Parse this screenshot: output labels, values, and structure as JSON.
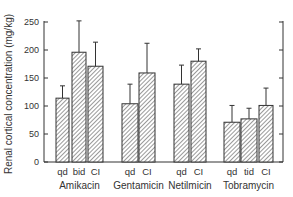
{
  "chart_data": {
    "type": "bar",
    "title": "",
    "xlabel": "",
    "ylabel": "Renal cortical concentration (mg/kg)",
    "ylim": [
      0,
      250
    ],
    "yticks": [
      0,
      50,
      100,
      150,
      200,
      250
    ],
    "grid": false,
    "legend": null,
    "error_bars": true,
    "bar_pattern": "diagonal-hatch",
    "groups": [
      {
        "name": "Amikacin",
        "bars": [
          {
            "label": "qd",
            "value": 114,
            "error_top": 136
          },
          {
            "label": "bid",
            "value": 196,
            "error_top": 252
          },
          {
            "label": "CI",
            "value": 171,
            "error_top": 214
          }
        ]
      },
      {
        "name": "Gentamicin",
        "bars": [
          {
            "label": "qd",
            "value": 104,
            "error_top": 139
          },
          {
            "label": "CI",
            "value": 159,
            "error_top": 212
          }
        ]
      },
      {
        "name": "Netilmicin",
        "bars": [
          {
            "label": "qd",
            "value": 139,
            "error_top": 173
          },
          {
            "label": "CI",
            "value": 180,
            "error_top": 202
          }
        ]
      },
      {
        "name": "Tobramycin",
        "bars": [
          {
            "label": "qd",
            "value": 71,
            "error_top": 101
          },
          {
            "label": "tid",
            "value": 77,
            "error_top": 96
          },
          {
            "label": "CI",
            "value": 101,
            "error_top": 132
          }
        ]
      }
    ]
  },
  "colors": {
    "axis": "#333333",
    "bar_fill": "#ffffff",
    "hatch": "#555555",
    "text": "#333333"
  }
}
